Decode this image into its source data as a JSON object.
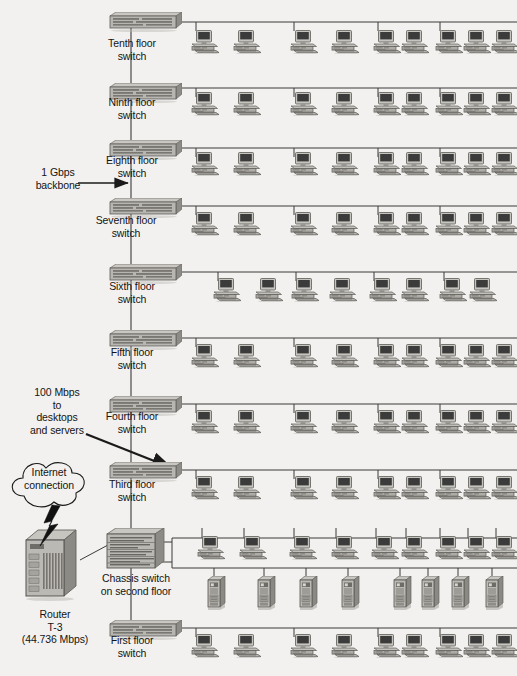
{
  "diagram": {
    "type": "network-topology",
    "background_color": "#f2f1ef",
    "line_color": "#3a3a3a",
    "device_fill": "#b4b2ad",
    "device_dark": "#74726d",
    "screen_color": "#3b3b3b"
  },
  "annotations": [
    {
      "id": "backbone",
      "text": "1 Gbps\nbackbone",
      "x": 22,
      "y": 166,
      "width": 72
    },
    {
      "id": "desktops",
      "text": "100 Mbps\nto\ndesktops\nand servers",
      "x": 14,
      "y": 386,
      "width": 86
    },
    {
      "id": "internet_cloud",
      "text": "Internet\nconnection",
      "x": 12,
      "y": 466,
      "width": 74
    },
    {
      "id": "router",
      "text": "Router\nT-3\n(44.736 Mbps)",
      "x": 8,
      "y": 608,
      "width": 94
    }
  ],
  "floors": [
    {
      "id": "floor-10",
      "label": "Tenth floor\nswitch",
      "switch_x": 104,
      "switch_y": 12,
      "label_x": 86,
      "label_y": 37,
      "bus_y": 22,
      "bus_x2": 517,
      "nodes": {
        "type": "workstation",
        "count": 9,
        "y": 30,
        "xs": [
          190,
          232,
          289,
          330,
          372,
          400,
          434,
          462,
          490
        ],
        "stubs": [
          196,
          294,
          378,
          440
        ]
      }
    },
    {
      "id": "floor-9",
      "label": "Ninth floor\nswitch",
      "switch_x": 104,
      "switch_y": 83,
      "label_x": 86,
      "label_y": 96,
      "bus_y": 88,
      "bus_x2": 517,
      "nodes": {
        "type": "workstation",
        "count": 9,
        "y": 92,
        "xs": [
          190,
          232,
          289,
          330,
          372,
          400,
          434,
          462,
          490
        ],
        "stubs": [
          196,
          294,
          378,
          440
        ]
      }
    },
    {
      "id": "floor-8",
      "label": "Eighth floor\nswitch",
      "switch_x": 104,
      "switch_y": 140,
      "label_x": 86,
      "label_y": 154,
      "bus_y": 148,
      "bus_x2": 517,
      "nodes": {
        "type": "workstation",
        "count": 9,
        "y": 152,
        "xs": [
          190,
          232,
          289,
          330,
          372,
          400,
          434,
          462,
          490
        ],
        "stubs": [
          196,
          294,
          378,
          440
        ]
      }
    },
    {
      "id": "floor-7",
      "label": "Seventh floor\nswitch",
      "switch_x": 104,
      "switch_y": 198,
      "label_x": 80,
      "label_y": 214,
      "bus_y": 206,
      "bus_x2": 517,
      "nodes": {
        "type": "workstation",
        "count": 9,
        "y": 212,
        "xs": [
          190,
          232,
          289,
          330,
          372,
          400,
          434,
          462,
          490
        ],
        "stubs": [
          196,
          294,
          378,
          440
        ]
      }
    },
    {
      "id": "floor-6",
      "label": "Sixth floor\nswitch",
      "switch_x": 104,
      "switch_y": 264,
      "label_x": 86,
      "label_y": 280,
      "bus_y": 272,
      "bus_x2": 517,
      "nodes": {
        "type": "workstation",
        "count": 8,
        "y": 278,
        "xs": [
          212,
          254,
          290,
          328,
          368,
          400,
          438,
          468
        ],
        "stubs": [
          218,
          296,
          374,
          444
        ]
      }
    },
    {
      "id": "floor-5",
      "label": "Fifth floor\nswitch",
      "switch_x": 104,
      "switch_y": 330,
      "label_x": 86,
      "label_y": 346,
      "bus_y": 338,
      "bus_x2": 517,
      "nodes": {
        "type": "workstation",
        "count": 9,
        "y": 344,
        "xs": [
          190,
          232,
          289,
          330,
          372,
          400,
          434,
          462,
          490
        ],
        "stubs": [
          196,
          294,
          378,
          440
        ]
      }
    },
    {
      "id": "floor-4",
      "label": "Fourth floor\nswitch",
      "switch_x": 104,
      "switch_y": 396,
      "label_x": 86,
      "label_y": 410,
      "bus_y": 404,
      "bus_x2": 517,
      "nodes": {
        "type": "workstation",
        "count": 9,
        "y": 410,
        "xs": [
          190,
          232,
          289,
          330,
          372,
          400,
          434,
          462,
          490
        ],
        "stubs": [
          196,
          294,
          378,
          440
        ]
      }
    },
    {
      "id": "floor-3",
      "label": "Third floor\nswitch",
      "switch_x": 104,
      "switch_y": 462,
      "label_x": 86,
      "label_y": 478,
      "bus_y": 470,
      "bus_x2": 517,
      "nodes": {
        "type": "workstation",
        "count": 9,
        "y": 476,
        "xs": [
          190,
          232,
          289,
          330,
          372,
          400,
          434,
          462,
          490
        ],
        "stubs": [
          196,
          294,
          378,
          440
        ]
      }
    },
    {
      "id": "floor-1",
      "label": "First floor\nswitch",
      "switch_x": 104,
      "switch_y": 620,
      "label_x": 86,
      "label_y": 634,
      "bus_y": 628,
      "bus_x2": 517,
      "nodes": {
        "type": "workstation",
        "count": 9,
        "y": 634,
        "xs": [
          190,
          232,
          289,
          330,
          372,
          400,
          434,
          462,
          490
        ],
        "stubs": [
          196,
          294,
          378,
          440
        ]
      }
    }
  ],
  "chassis": {
    "id": "floor-2",
    "label": "Chassis switch\non second floor",
    "x": 103,
    "y": 528,
    "label_x": 84,
    "label_y": 572,
    "upper_bus_y": 538,
    "lower_bus_y": 568,
    "bus_x1": 172,
    "bus_x2": 517,
    "workstations": {
      "count": 9,
      "y": 536,
      "xs": [
        196,
        238,
        288,
        330,
        370,
        400,
        434,
        462,
        490
      ],
      "stubs": [
        202,
        244,
        294,
        336,
        376,
        406,
        440,
        468,
        496
      ]
    },
    "servers": {
      "count": 8,
      "y": 570,
      "xs": [
        206,
        256,
        298,
        340,
        392,
        420,
        450,
        484
      ],
      "stubs": [
        214,
        264,
        306,
        348,
        400,
        428,
        458,
        492
      ]
    }
  },
  "backbone": {
    "x": 131,
    "segments": [
      [
        22,
        628
      ]
    ],
    "arrow": {
      "from_x": 78,
      "to_x": 128,
      "y": 183
    }
  },
  "desktops_arrow": {
    "from_x": 86,
    "from_y": 434,
    "to_x": 172,
    "to_y": 468
  },
  "cloud": {
    "x": 10,
    "y": 458,
    "w": 78,
    "h": 54
  },
  "router": {
    "x": 24,
    "y": 530,
    "w": 54,
    "h": 70
  },
  "cloud_link": {
    "from_x": 52,
    "from_y": 512,
    "to_x": 54,
    "to_y": 534
  },
  "router_link": {
    "from_x": 80,
    "from_y": 560,
    "to_x": 108,
    "to_y": 545
  }
}
